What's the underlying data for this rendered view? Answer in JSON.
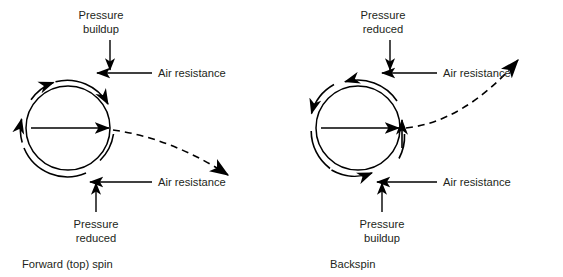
{
  "figure": {
    "background_color": "#ffffff",
    "ink_color": "#231f20",
    "panels": [
      {
        "id": "forward-top-spin",
        "caption": "Forward (top) spin",
        "spin_direction": "clockwise",
        "trajectory": "curves downward",
        "labels": {
          "top_pressure_line1": "Pressure",
          "top_pressure_line2": "buildup",
          "bottom_pressure_line1": "Pressure",
          "bottom_pressure_line2": "reduced",
          "air_resistance_top": "Air resistance",
          "air_resistance_bottom": "Air resistance"
        }
      },
      {
        "id": "backspin",
        "caption": "Backspin",
        "spin_direction": "counterclockwise",
        "trajectory": "curves upward",
        "labels": {
          "top_pressure_line1": "Pressure",
          "top_pressure_line2": "reduced",
          "bottom_pressure_line1": "Pressure",
          "bottom_pressure_line2": "buildup",
          "air_resistance_top": "Air resistance",
          "air_resistance_bottom": "Air resistance"
        }
      }
    ]
  }
}
